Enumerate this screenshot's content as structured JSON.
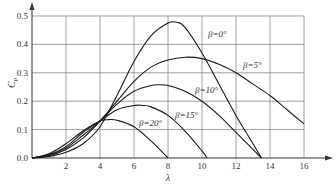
{
  "chart_data": {
    "type": "line",
    "title": "",
    "xlabel": "λ",
    "ylabel": "Cp",
    "xlim": [
      0,
      17
    ],
    "ylim": [
      0,
      0.55
    ],
    "grid": true,
    "x_ticks": [
      "2",
      "4",
      "6",
      "8",
      "10",
      "12",
      "14",
      "16"
    ],
    "y_ticks": [
      "0.0",
      "0.1",
      "0.2",
      "0.3",
      "0.4",
      "0.5"
    ],
    "legend_position": "inline labels",
    "series": [
      {
        "name": "β=0°",
        "label": "β=0°",
        "points": [
          [
            0,
            0
          ],
          [
            1,
            0.005
          ],
          [
            2,
            0.02
          ],
          [
            3,
            0.05
          ],
          [
            4,
            0.11
          ],
          [
            5,
            0.22
          ],
          [
            6,
            0.34
          ],
          [
            7,
            0.43
          ],
          [
            8,
            0.475
          ],
          [
            8.5,
            0.478
          ],
          [
            9,
            0.46
          ],
          [
            10,
            0.37
          ],
          [
            11,
            0.26
          ],
          [
            12,
            0.15
          ],
          [
            13,
            0.05
          ],
          [
            13.5,
            0
          ]
        ]
      },
      {
        "name": "β=5°",
        "label": "β=5°",
        "points": [
          [
            0,
            0
          ],
          [
            1,
            0.008
          ],
          [
            2,
            0.03
          ],
          [
            3,
            0.07
          ],
          [
            4,
            0.13
          ],
          [
            5,
            0.2
          ],
          [
            6,
            0.27
          ],
          [
            7,
            0.32
          ],
          [
            8,
            0.345
          ],
          [
            9,
            0.355
          ],
          [
            10,
            0.35
          ],
          [
            11,
            0.33
          ],
          [
            12,
            0.3
          ],
          [
            13,
            0.26
          ],
          [
            14,
            0.22
          ],
          [
            15,
            0.17
          ],
          [
            16,
            0.12
          ]
        ]
      },
      {
        "name": "β=10°",
        "label": "β=10°",
        "points": [
          [
            0,
            0
          ],
          [
            1,
            0.01
          ],
          [
            2,
            0.035
          ],
          [
            3,
            0.08
          ],
          [
            4,
            0.13
          ],
          [
            5,
            0.19
          ],
          [
            6,
            0.235
          ],
          [
            7,
            0.255
          ],
          [
            7.5,
            0.258
          ],
          [
            8,
            0.255
          ],
          [
            9,
            0.235
          ],
          [
            10,
            0.2
          ],
          [
            11,
            0.15
          ],
          [
            12,
            0.09
          ],
          [
            13,
            0.03
          ],
          [
            13.5,
            0
          ]
        ]
      },
      {
        "name": "β=15°",
        "label": "β=15°",
        "points": [
          [
            0,
            0
          ],
          [
            1,
            0.012
          ],
          [
            2,
            0.04
          ],
          [
            3,
            0.09
          ],
          [
            4,
            0.13
          ],
          [
            5,
            0.17
          ],
          [
            6,
            0.185
          ],
          [
            6.5,
            0.185
          ],
          [
            7,
            0.18
          ],
          [
            8,
            0.15
          ],
          [
            9,
            0.095
          ],
          [
            10,
            0.025
          ],
          [
            10.3,
            0
          ]
        ]
      },
      {
        "name": "β=20°",
        "label": "β=20°",
        "points": [
          [
            0,
            0
          ],
          [
            1,
            0.015
          ],
          [
            2,
            0.05
          ],
          [
            3,
            0.095
          ],
          [
            4,
            0.13
          ],
          [
            4.5,
            0.135
          ],
          [
            5,
            0.133
          ],
          [
            6,
            0.11
          ],
          [
            7,
            0.06
          ],
          [
            8,
            0
          ]
        ]
      }
    ]
  },
  "axes": {
    "xlabel": "λ",
    "ylabel_main": "C",
    "ylabel_sub": "p",
    "y_tick_labels": [
      "0.0",
      "0.1",
      "0.2",
      "0.3",
      "0.4",
      "0.5"
    ],
    "x_tick_labels": [
      "2",
      "4",
      "6",
      "8",
      "10",
      "12",
      "14",
      "16"
    ]
  },
  "labels": {
    "beta0": "β=0°",
    "beta5": "β=5°",
    "beta10": "β=10°",
    "beta15": "β=15°",
    "beta20": "β=20°"
  }
}
